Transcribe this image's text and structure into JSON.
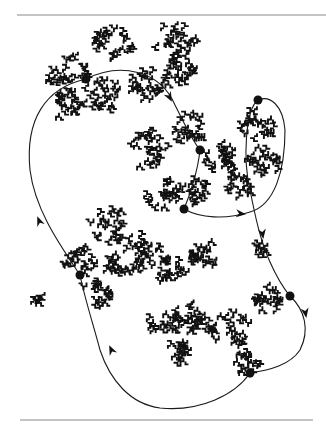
{
  "figure": {
    "colors": {
      "ink": "#111111",
      "rule": "#8a8a8a",
      "background": "#ffffff"
    },
    "rules": [
      {
        "name": "top-rule",
        "x1": 17,
        "y1": 15,
        "x2": 326,
        "y2": 15
      },
      {
        "name": "bottom-rule",
        "x1": 20,
        "y1": 420,
        "x2": 313,
        "y2": 420
      }
    ],
    "nodes": [
      {
        "id": 1,
        "x": 86,
        "y": 79
      },
      {
        "id": 2,
        "x": 200,
        "y": 150
      },
      {
        "id": 3,
        "x": 258,
        "y": 100
      },
      {
        "id": 4,
        "x": 184,
        "y": 209
      },
      {
        "id": 5,
        "x": 290,
        "y": 296
      },
      {
        "id": 6,
        "x": 250,
        "y": 373
      },
      {
        "id": 7,
        "x": 80,
        "y": 275
      }
    ],
    "arrows": [
      {
        "x": 171,
        "y": 100,
        "angle": 62
      },
      {
        "x": 244,
        "y": 214,
        "angle": 5
      },
      {
        "x": 263,
        "y": 237,
        "angle": 82
      },
      {
        "x": 306,
        "y": 316,
        "angle": 80
      },
      {
        "x": 110,
        "y": 347,
        "angle": -115
      },
      {
        "x": 38,
        "y": 218,
        "angle": -112
      }
    ],
    "clusters": [
      {
        "cx": 112,
        "cy": 40,
        "r": 22
      },
      {
        "cx": 175,
        "cy": 42,
        "r": 22
      },
      {
        "cx": 70,
        "cy": 75,
        "r": 22
      },
      {
        "cx": 100,
        "cy": 95,
        "r": 20
      },
      {
        "cx": 68,
        "cy": 105,
        "r": 16
      },
      {
        "cx": 150,
        "cy": 85,
        "r": 20
      },
      {
        "cx": 178,
        "cy": 70,
        "r": 16
      },
      {
        "cx": 148,
        "cy": 150,
        "r": 22
      },
      {
        "cx": 190,
        "cy": 130,
        "r": 18
      },
      {
        "cx": 220,
        "cy": 160,
        "r": 20
      },
      {
        "cx": 258,
        "cy": 125,
        "r": 18
      },
      {
        "cx": 265,
        "cy": 160,
        "r": 18
      },
      {
        "cx": 240,
        "cy": 185,
        "r": 14
      },
      {
        "cx": 165,
        "cy": 195,
        "r": 18
      },
      {
        "cx": 195,
        "cy": 190,
        "r": 14
      },
      {
        "cx": 110,
        "cy": 225,
        "r": 20
      },
      {
        "cx": 80,
        "cy": 262,
        "r": 16
      },
      {
        "cx": 95,
        "cy": 295,
        "r": 16
      },
      {
        "cx": 140,
        "cy": 250,
        "r": 22
      },
      {
        "cx": 170,
        "cy": 270,
        "r": 16
      },
      {
        "cx": 205,
        "cy": 255,
        "r": 16
      },
      {
        "cx": 120,
        "cy": 265,
        "r": 14
      },
      {
        "cx": 195,
        "cy": 320,
        "r": 18
      },
      {
        "cx": 230,
        "cy": 330,
        "r": 20
      },
      {
        "cx": 270,
        "cy": 300,
        "r": 16
      },
      {
        "cx": 165,
        "cy": 320,
        "r": 16
      },
      {
        "cx": 180,
        "cy": 352,
        "r": 14
      },
      {
        "cx": 250,
        "cy": 362,
        "r": 14
      },
      {
        "cx": 260,
        "cy": 248,
        "r": 8
      },
      {
        "cx": 40,
        "cy": 300,
        "r": 6
      }
    ]
  }
}
